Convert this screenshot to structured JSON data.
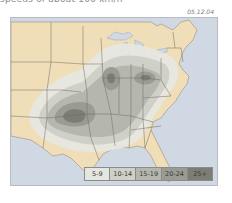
{
  "header": {
    "caption": "speeds of about 100 km/h",
    "date": "05.12.04"
  },
  "map": {
    "region": "Contiguous United States (eastern two-thirds)",
    "colors": {
      "water": "#cfd8e3",
      "land": "#f0deb8",
      "state_borders": "#6e6a5e",
      "band_5_9": "#e6e6e0",
      "band_10_14": "#cfd0c8",
      "band_15_19": "#b5b7ae",
      "band_20_24": "#9a9c93",
      "band_25_plus": "#7c7e76"
    }
  },
  "legend": {
    "items": [
      {
        "label": "5-9",
        "color": "#e6e6e0"
      },
      {
        "label": "10-14",
        "color": "#cfd0c8"
      },
      {
        "label": "15-19",
        "color": "#b5b7ae"
      },
      {
        "label": "20-24",
        "color": "#9a9c93"
      },
      {
        "label": "25+",
        "color": "#7c7e76"
      }
    ]
  }
}
